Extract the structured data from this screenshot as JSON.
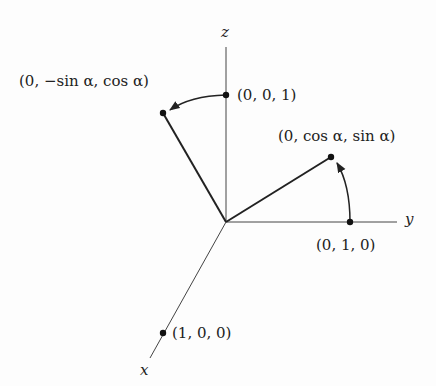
{
  "diagram": {
    "type": "3d-rotation-about-x-axis",
    "axes": {
      "x": {
        "label": "x"
      },
      "y": {
        "label": "y"
      },
      "z": {
        "label": "z"
      }
    },
    "points": {
      "e1": {
        "label": "(1, 0, 0)"
      },
      "e2": {
        "label": "(0, 1, 0)"
      },
      "e3": {
        "label": "(0, 0, 1)"
      },
      "rot_e2": {
        "label": "(0, cos α, sin α)"
      },
      "rot_e3": {
        "label": "(0, −sin α, cos α)"
      }
    },
    "colors": {
      "ink": "#222222",
      "background": "#fdfdfd"
    }
  }
}
